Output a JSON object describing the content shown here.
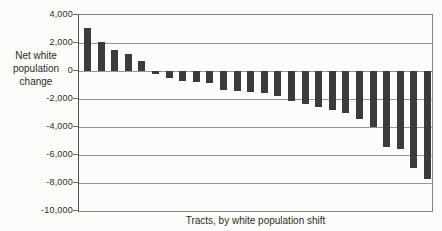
{
  "chart_data": {
    "type": "bar",
    "title": "",
    "xlabel": "Tracts, by white population shift",
    "ylabel": "Net white population change",
    "ylabel_lines": [
      "Net white",
      "population",
      "change"
    ],
    "ylim": [
      -10000,
      4000
    ],
    "yticks": [
      4000,
      2000,
      0,
      -2000,
      -4000,
      -6000,
      -8000,
      -10000
    ],
    "ytick_labels": [
      "4,000",
      "2,000",
      "0",
      "-2,000",
      "-4,000",
      "-6,000",
      "-8,000",
      "-10,000"
    ],
    "grid": true,
    "legend": "none",
    "bar_color": "#3b3b3b",
    "n_bars": 26,
    "values": [
      3100,
      2100,
      1500,
      1250,
      700,
      -200,
      -500,
      -700,
      -750,
      -850,
      -1350,
      -1400,
      -1500,
      -1600,
      -1800,
      -2150,
      -2350,
      -2600,
      -2800,
      -3000,
      -3400,
      -4000,
      -5400,
      -5600,
      -6900,
      -7700
    ]
  }
}
